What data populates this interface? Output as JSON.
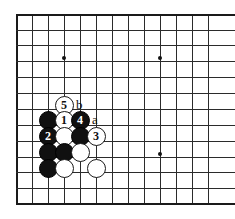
{
  "figure": {
    "kind": "go-board-diagram",
    "board_columns": 13,
    "board_rows": 13,
    "cell_size": 16,
    "origin_x": 16,
    "origin_y": 14,
    "colors": {
      "grid": "#2b2b2b",
      "edge": "#1a1a1a",
      "black_stone": "#101010",
      "white_stone": "#ffffff",
      "background": "#ffffff",
      "star_point": "#111111"
    }
  },
  "grid": {
    "vertical_x": [
      16,
      32,
      48,
      64,
      80,
      96,
      112,
      128,
      144,
      160,
      176,
      192,
      208
    ],
    "horizontal_y": [
      14,
      30,
      45,
      61,
      77,
      93,
      109,
      125,
      141,
      157,
      172,
      188,
      203
    ],
    "edge_left_x": 16,
    "edge_top_y": 14,
    "edge_bottom_y": 203
  },
  "star_points": [
    {
      "name": "star-point-upper-left",
      "x": 64,
      "y": 58
    },
    {
      "name": "star-point-upper-right",
      "x": 160,
      "y": 58
    },
    {
      "name": "star-point-lower-right",
      "x": 160,
      "y": 154
    }
  ],
  "stones": [
    {
      "name": "white-stone-5",
      "color": "white",
      "label": "5",
      "x": 64,
      "y": 105
    },
    {
      "name": "black-stone-plain-a",
      "color": "black",
      "label": "",
      "x": 48,
      "y": 120
    },
    {
      "name": "white-stone-1",
      "color": "white",
      "label": "1",
      "x": 64,
      "y": 120
    },
    {
      "name": "black-stone-4",
      "color": "black",
      "label": "4",
      "x": 80,
      "y": 120
    },
    {
      "name": "black-stone-2",
      "color": "black",
      "label": "2",
      "x": 48,
      "y": 136
    },
    {
      "name": "white-stone-plain-b",
      "color": "white",
      "label": "",
      "x": 64,
      "y": 136
    },
    {
      "name": "black-stone-plain-c",
      "color": "black",
      "label": "",
      "x": 80,
      "y": 136
    },
    {
      "name": "white-stone-3",
      "color": "white",
      "label": "3",
      "x": 96,
      "y": 136
    },
    {
      "name": "black-stone-plain-d",
      "color": "black",
      "label": "",
      "x": 48,
      "y": 152
    },
    {
      "name": "black-stone-plain-e",
      "color": "black",
      "label": "",
      "x": 64,
      "y": 152
    },
    {
      "name": "white-stone-plain-f",
      "color": "white",
      "label": "",
      "x": 80,
      "y": 152
    },
    {
      "name": "black-stone-plain-g",
      "color": "black",
      "label": "",
      "x": 48,
      "y": 168
    },
    {
      "name": "white-stone-plain-h",
      "color": "white",
      "label": "",
      "x": 64,
      "y": 168
    },
    {
      "name": "white-stone-plain-i",
      "color": "white",
      "label": "",
      "x": 96,
      "y": 168
    }
  ],
  "move_labels": {
    "one": "1",
    "two": "2",
    "three": "3",
    "four": "4",
    "five": "5"
  },
  "point_labels": [
    {
      "name": "point-label-b",
      "text": "b",
      "x": 80,
      "y": 105
    },
    {
      "name": "point-label-a",
      "text": "a",
      "x": 96,
      "y": 120
    }
  ]
}
